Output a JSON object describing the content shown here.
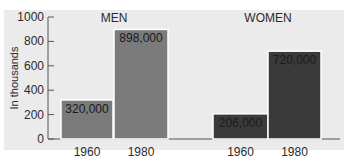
{
  "chart_data": {
    "type": "bar",
    "title": "",
    "xlabel": "",
    "ylabel": "In thousands",
    "ylim": [
      0,
      1000
    ],
    "yticks": [
      0,
      200,
      400,
      600,
      800,
      1000
    ],
    "groups": [
      "MEN",
      "WOMEN"
    ],
    "categories": [
      "1960",
      "1980"
    ],
    "series": [
      {
        "name": "MEN",
        "categories": [
          "1960",
          "1980"
        ],
        "values": [
          320,
          898
        ],
        "labels": [
          "320,000",
          "898,000"
        ],
        "color": "#7b7b7b"
      },
      {
        "name": "WOMEN",
        "categories": [
          "1960",
          "1980"
        ],
        "values": [
          206,
          720
        ],
        "labels": [
          "206,000",
          "720,000"
        ],
        "color": "#3a3a3a"
      }
    ],
    "grid": false,
    "legend": "none"
  },
  "colors": {
    "background": "#ebebeb",
    "men_bar": "#7b7b7b",
    "women_bar": "#3a3a3a",
    "axis": "#555555",
    "bar_border": "#ffffff"
  }
}
